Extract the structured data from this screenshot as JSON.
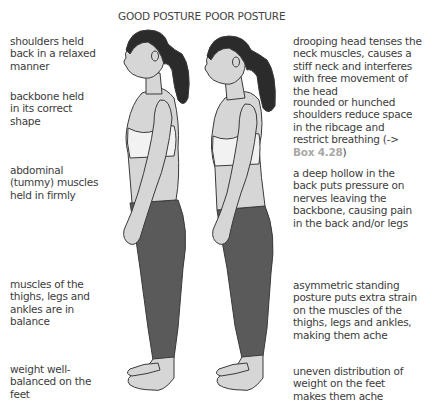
{
  "titles": {
    "good": "GOOD POSTURE",
    "poor": "POOR POSTURE"
  },
  "good_labels": [
    {
      "text": "shoulders held back in a relaxed manner"
    },
    {
      "text": "backbone held in its correct shape"
    },
    {
      "text": "abdominal (tummy) muscles held in firmly"
    },
    {
      "text": "muscles of the thighs, legs and ankles are in balance"
    },
    {
      "text": "weight well-balanced on the feet"
    }
  ],
  "poor_labels": [
    {
      "text": "drooping head tenses the neck muscles, causes a stiff neck and interferes with free movement of the head"
    },
    {
      "text_before": "rounded or hunched shoulders reduce space in the ribcage and restrict breathing (-> ",
      "ref": "Box 4.28",
      "text_after": ")"
    },
    {
      "text": "a deep hollow in the back puts pressure on nerves leaving the backbone, causing pain in the back and/or legs"
    },
    {
      "text": "asymmetric standing posture puts extra strain on the muscles of the thighs, legs and ankles, making them ache"
    },
    {
      "text": "uneven distribution of weight on the feet makes them ache"
    }
  ],
  "colors": {
    "hair": "#2b2b2b",
    "skin": "#d6d6d6",
    "top": "#f2f2f2",
    "leggings": "#5a5a5a",
    "outline": "#3a3a3a",
    "ref": "#a8a8a8"
  }
}
